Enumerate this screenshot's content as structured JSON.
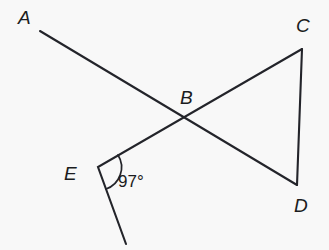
{
  "figure": {
    "type": "geometry-diagram",
    "background_color": "#f8f8f8",
    "stroke_color": "#23242a",
    "width": 329,
    "height": 250,
    "points": {
      "A": {
        "label": "A",
        "x": 40,
        "y": 31,
        "label_x": 18,
        "label_y": 24
      },
      "B": {
        "label": "B",
        "x": 188,
        "y": 115,
        "label_x": 180,
        "label_y": 104
      },
      "C": {
        "label": "C",
        "x": 302,
        "y": 49,
        "label_x": 296,
        "label_y": 32
      },
      "D": {
        "label": "D",
        "x": 297,
        "y": 185,
        "label_x": 294,
        "label_y": 212
      },
      "E": {
        "label": "E",
        "x": 98,
        "y": 167,
        "label_x": 64,
        "label_y": 180
      },
      "F": {
        "label": "",
        "x": 126,
        "y": 244,
        "label_x": 0,
        "label_y": 0
      }
    },
    "segments": [
      {
        "name": "segment-A-D",
        "from": "A",
        "to": "D"
      },
      {
        "name": "segment-C-E-extended",
        "from": "C",
        "to": "F"
      },
      {
        "name": "segment-C-D",
        "from": "C",
        "to": "D"
      }
    ],
    "angle_marks": [
      {
        "name": "angle-at-E",
        "vertex": "E",
        "value": "97°",
        "label_x": 118,
        "label_y": 187,
        "radius": 23
      }
    ]
  }
}
